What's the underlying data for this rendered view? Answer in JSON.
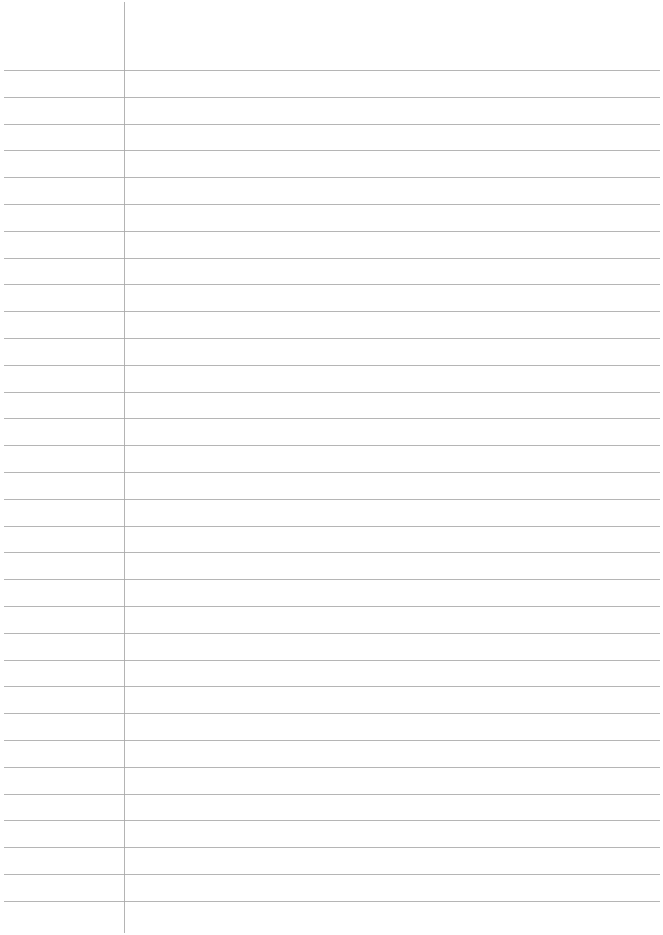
{
  "page": {
    "type": "lined-paper",
    "background_color": "#ffffff",
    "rule_color": "#a8a8a8",
    "margin_line_color": "#b4b4b4",
    "rule_count": 32,
    "first_rule_y": 70,
    "rule_spacing": 26.8,
    "margin_line_x": 124
  }
}
